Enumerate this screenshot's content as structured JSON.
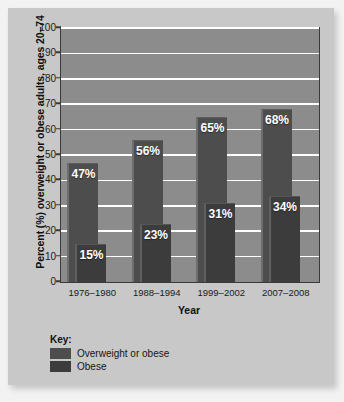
{
  "chart_data": {
    "type": "bar",
    "title": "",
    "xlabel": "Year",
    "ylabel": "Percent (%) overweight or obese adults, ages 20–74",
    "categories": [
      "1976–1980",
      "1988–1994",
      "1999–2002",
      "2007–2008"
    ],
    "series": [
      {
        "name": "Overweight or obese",
        "color": "#4d4d4d",
        "values": [
          47,
          56,
          65,
          68
        ],
        "labels": [
          "47%",
          "56%",
          "65%",
          "68%"
        ]
      },
      {
        "name": "Obese",
        "color": "#3c3c3c",
        "values": [
          15,
          23,
          31,
          34
        ],
        "labels": [
          "15%",
          "23%",
          "31%",
          "34%"
        ]
      }
    ],
    "ylim": [
      0,
      100
    ],
    "y_ticks": [
      0,
      10,
      20,
      30,
      40,
      50,
      60,
      70,
      80,
      90,
      100
    ],
    "y_tick_labels": [
      "0",
      "10",
      "20",
      "30",
      "40",
      "50",
      "60",
      "70",
      "80",
      "90",
      "100"
    ],
    "grid": "horizontal",
    "legend_position": "below-plot-left",
    "legend_title": "Key:",
    "plot_background": "#8c8c8c",
    "figure_background": "#c8c8c8",
    "gridline_color": "#ffffff"
  }
}
